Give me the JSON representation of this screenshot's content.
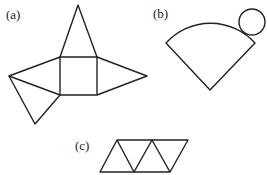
{
  "diagram": {
    "labels": {
      "a": "(a)",
      "b": "(b)",
      "c": "(c)"
    },
    "nets": [
      {
        "id": "a",
        "description": "Square pyramid net: square base with four triangles"
      },
      {
        "id": "b",
        "description": "Cone net: circular sector with circle"
      },
      {
        "id": "c",
        "description": "Tetrahedron net: strip of four triangles"
      }
    ]
  }
}
